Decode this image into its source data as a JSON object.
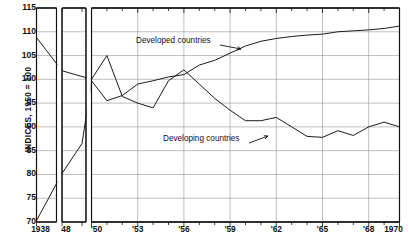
{
  "chart_data": {
    "type": "line",
    "title": "",
    "xlabel": "",
    "ylabel": "INDICES, 1950 = 100",
    "ylim": [
      70,
      115
    ],
    "yticks": [
      70,
      75,
      80,
      85,
      90,
      95,
      100,
      105,
      110,
      115
    ],
    "xtick_labels": [
      "1938",
      "'48",
      "'50",
      "'53",
      "'56",
      "'59",
      "'62",
      "'65",
      "'68",
      "1970"
    ],
    "grid": true,
    "legend_position": "inline-annotations",
    "axis_break": true,
    "panels": [
      {
        "name": "panel-1938",
        "x_start": 1938,
        "x_end": 1938
      },
      {
        "name": "panel-1948-1949",
        "x_start": 1948,
        "x_end": 1949
      },
      {
        "name": "panel-1950-1970",
        "x_start": 1950,
        "x_end": 1970
      }
    ],
    "series": [
      {
        "name": "Developed countries",
        "color": "#1a1a1a",
        "x": [
          1938,
          1948,
          1949,
          1950,
          1951,
          1952,
          1953,
          1954,
          1955,
          1956,
          1957,
          1958,
          1959,
          1960,
          1961,
          1962,
          1963,
          1964,
          1965,
          1966,
          1967,
          1968,
          1969,
          1970
        ],
        "values": [
          70.3,
          80.2,
          86.5,
          99.7,
          95.5,
          96.6,
          99.0,
          99.7,
          100.5,
          101.0,
          103.0,
          104.0,
          105.5,
          107.0,
          108.0,
          108.6,
          109.0,
          109.3,
          109.5,
          110.0,
          110.2,
          110.4,
          110.7,
          111.2
        ]
      },
      {
        "name": "Developing countries",
        "color": "#1a1a1a",
        "x": [
          1938,
          1948,
          1949,
          1950,
          1951,
          1952,
          1953,
          1954,
          1955,
          1956,
          1957,
          1958,
          1959,
          1960,
          1961,
          1962,
          1963,
          1964,
          1965,
          1966,
          1967,
          1968,
          1969,
          1970
        ],
        "values": [
          108.8,
          101.8,
          100.6,
          100.0,
          105.0,
          96.4,
          95.0,
          94.0,
          99.7,
          102.0,
          99.0,
          96.0,
          93.5,
          91.3,
          91.3,
          92.0,
          90.0,
          88.0,
          87.8,
          89.2,
          88.2,
          90.0,
          91.0,
          90.0
        ]
      }
    ],
    "annotations": [
      {
        "text": "Developed countries",
        "target_series": "Developed countries",
        "arrow": true
      },
      {
        "text": "Developing countries",
        "target_series": "Developing countries",
        "arrow": true
      }
    ]
  }
}
